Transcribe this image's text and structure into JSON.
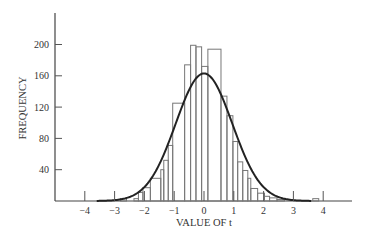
{
  "chart_data": {
    "type": "bar",
    "title": "",
    "xlabel": "VALUE OF t",
    "ylabel": "FREQUENCY",
    "xlim": [
      -5,
      5
    ],
    "ylim": [
      0,
      240
    ],
    "x_ticks": [
      -4,
      -3,
      -2,
      -1,
      0,
      1,
      2,
      3,
      4
    ],
    "x_tick_labels": [
      "-4",
      "-3",
      "-2",
      "-1",
      "0",
      "1",
      "2",
      "3",
      "4"
    ],
    "y_ticks": [
      40,
      80,
      120,
      160,
      200
    ],
    "y_tick_labels": [
      "40",
      "80",
      "120",
      "160",
      "200"
    ],
    "grid": false,
    "legend": "none",
    "series": [
      {
        "name": "histogram",
        "kind": "step",
        "bins": [
          {
            "x0": -2.8,
            "x1": -2.6,
            "value": 3
          },
          {
            "x0": -2.35,
            "x1": -2.2,
            "value": 3
          },
          {
            "x0": -2.2,
            "x1": -2.05,
            "value": 11
          },
          {
            "x0": -2.05,
            "x1": -1.8,
            "value": 17
          },
          {
            "x0": -1.8,
            "x1": -1.45,
            "value": 29
          },
          {
            "x0": -1.45,
            "x1": -1.35,
            "value": 40
          },
          {
            "x0": -1.35,
            "x1": -1.2,
            "value": 52
          },
          {
            "x0": -1.2,
            "x1": -1.05,
            "value": 71
          },
          {
            "x0": -1.05,
            "x1": -0.65,
            "value": 125
          },
          {
            "x0": -0.65,
            "x1": -0.45,
            "value": 174
          },
          {
            "x0": -0.45,
            "x1": -0.27,
            "value": 199
          },
          {
            "x0": -0.27,
            "x1": -0.08,
            "value": 197
          },
          {
            "x0": -0.08,
            "x1": 0.13,
            "value": 172
          },
          {
            "x0": 0.13,
            "x1": 0.57,
            "value": 194
          },
          {
            "x0": 0.57,
            "x1": 0.77,
            "value": 134
          },
          {
            "x0": 0.77,
            "x1": 0.97,
            "value": 109
          },
          {
            "x0": 0.97,
            "x1": 1.13,
            "value": 76
          },
          {
            "x0": 1.13,
            "x1": 1.3,
            "value": 50
          },
          {
            "x0": 1.3,
            "x1": 1.47,
            "value": 39
          },
          {
            "x0": 1.47,
            "x1": 1.57,
            "value": 29
          },
          {
            "x0": 1.57,
            "x1": 1.8,
            "value": 16
          },
          {
            "x0": 1.8,
            "x1": 2.03,
            "value": 10
          },
          {
            "x0": 2.03,
            "x1": 2.2,
            "value": 6
          },
          {
            "x0": 2.2,
            "x1": 2.45,
            "value": 4
          },
          {
            "x0": 2.45,
            "x1": 2.7,
            "value": 2
          },
          {
            "x0": 3.65,
            "x1": 3.85,
            "value": 3
          }
        ]
      },
      {
        "name": "normal curve",
        "kind": "line",
        "peak": 163,
        "mean": 0,
        "sd": 0.95,
        "x_range": [
          -3.6,
          3.6
        ]
      }
    ]
  }
}
